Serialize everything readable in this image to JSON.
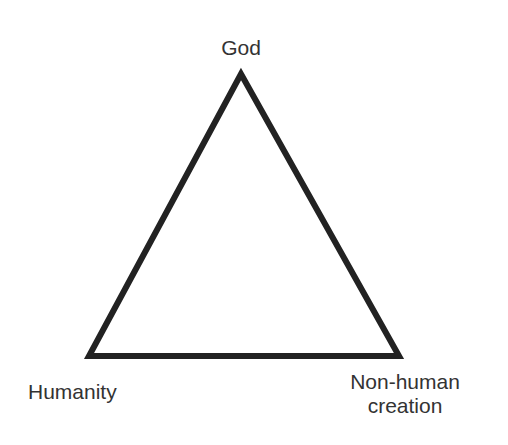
{
  "diagram": {
    "type": "triangle",
    "stroke_color": "#222222",
    "stroke_width": 6,
    "vertices": {
      "top": {
        "label": "God"
      },
      "bottom_left": {
        "label": "Humanity"
      },
      "bottom_right": {
        "label_line1": "Non-human",
        "label_line2": "creation"
      }
    }
  }
}
